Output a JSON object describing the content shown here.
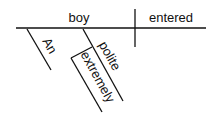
{
  "diagram": {
    "type": "sentence-diagram",
    "subject": "boy",
    "verb": "entered",
    "modifiers": {
      "article": "An",
      "adjective": "polite",
      "adverb": "extremely"
    }
  }
}
